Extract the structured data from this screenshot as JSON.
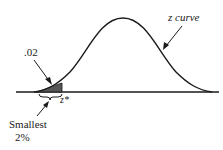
{
  "figure": {
    "curve_label": "z curve",
    "area_label": ".02",
    "critical_value_label": "z*",
    "region_label_line1": "Smallest",
    "region_label_line2": "2%",
    "tail_area": 0.02,
    "tail": "lower",
    "colors": {
      "curve": "#1a1a1a",
      "shade": "#555555",
      "background": "#ffffff"
    }
  }
}
